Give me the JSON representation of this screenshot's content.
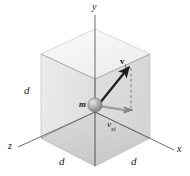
{
  "figure": {
    "type": "physics-diagram-3d-cube",
    "background_color": "#ffffff",
    "line_color": "#4d4d4d",
    "axis_color": "#585858",
    "vector_color": "#1a1a1a",
    "face_top_color": "#f3f3f3",
    "face_left_color": "#e7e7e7",
    "face_right_color": "#dcdcdc",
    "face_floor_color": "#d2d2d2",
    "face_back_color": "#eaeaea",
    "sphere_color": "#9a9a9a"
  },
  "axes": {
    "y_label": "y",
    "x_label": "x",
    "z_label": "z"
  },
  "dimensions": {
    "edge_left_label": "d",
    "edge_front_left_label": "d",
    "edge_front_right_label": "d"
  },
  "particle": {
    "mass_label": "m"
  },
  "vectors": [
    {
      "name": "velocity-initial",
      "symbol": "v",
      "subscript": "i",
      "style": "bold",
      "direction": "up-right"
    },
    {
      "name": "velocity-x-component",
      "symbol": "v",
      "subscript": "xi",
      "style": "italic",
      "direction": "right"
    }
  ],
  "guides": {
    "dashed_projection": "vertical dashed line from vector tip to x-component tip"
  }
}
